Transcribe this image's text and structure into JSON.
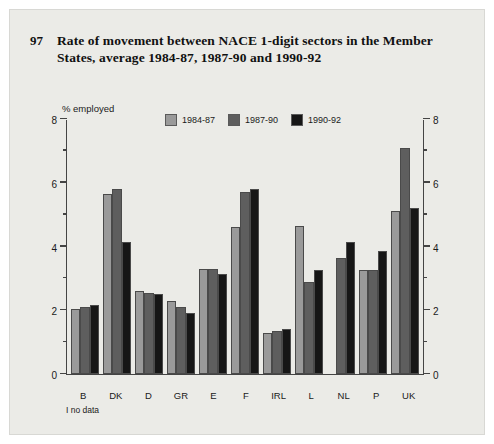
{
  "figure": {
    "number": "97",
    "title": "Rate of movement between NACE 1-digit sectors in the Member States, average 1984-87, 1987-90 and 1990-92",
    "footnote": "I no data"
  },
  "chart_data": {
    "type": "bar",
    "title": "Rate of movement between NACE 1-digit sectors in the Member States, average 1984-87, 1987-90 and 1990-92",
    "xlabel": "",
    "ylabel": "% employed",
    "ylim": [
      0,
      8
    ],
    "yticks": [
      "0",
      "2",
      "4",
      "6",
      "8"
    ],
    "ytick_minor": [
      "1",
      "3",
      "5",
      "7"
    ],
    "grid": false,
    "legend_position": "top-center",
    "axis_labels_both_sides": true,
    "categories": [
      "B",
      "DK",
      "D",
      "GR",
      "E",
      "F",
      "IRL",
      "L",
      "NL",
      "P",
      "UK"
    ],
    "series": [
      {
        "name": "1984-87",
        "color": "#9a9a9a",
        "values": [
          2.05,
          5.65,
          2.6,
          2.3,
          3.3,
          4.6,
          1.3,
          4.65,
          null,
          3.25,
          5.1
        ]
      },
      {
        "name": "1987-90",
        "color": "#5e5e5e",
        "values": [
          2.1,
          5.8,
          2.55,
          2.1,
          3.3,
          5.7,
          1.35,
          2.9,
          3.65,
          3.25,
          7.1
        ]
      },
      {
        "name": "1990-92",
        "color": "#161616",
        "values": [
          2.15,
          4.15,
          2.5,
          1.9,
          3.15,
          5.8,
          1.4,
          3.25,
          4.15,
          3.85,
          5.2
        ]
      }
    ]
  }
}
